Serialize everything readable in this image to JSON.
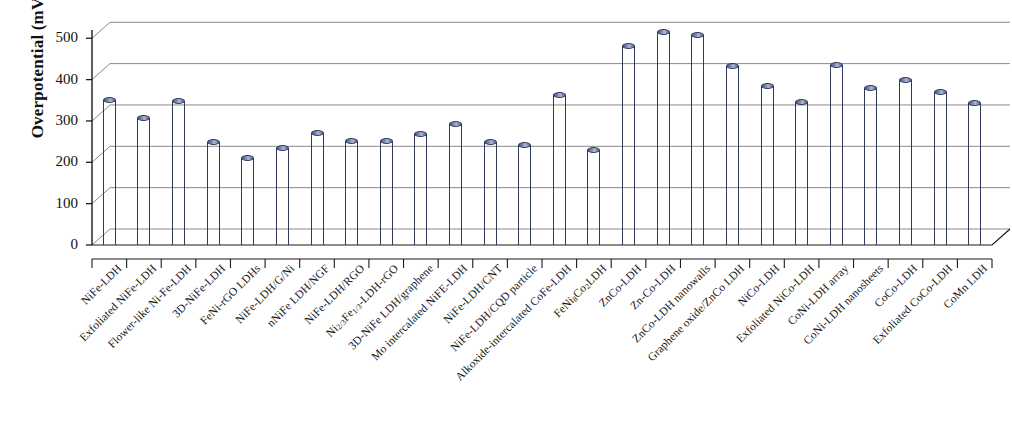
{
  "chart_data": {
    "type": "bar",
    "title": "",
    "xlabel": "",
    "ylabel": "Overpotential (mV)",
    "ylim": [
      0,
      520
    ],
    "yticks": [
      0,
      100,
      200,
      300,
      400,
      500
    ],
    "grid": true,
    "legend": "none",
    "bar_color": "#6c7ba6",
    "categories": [
      "NiFe-LDH",
      "Exfoliated NiFe-LDH",
      "Flower-like Ni-Fe-LDH",
      "3D-NiFe-LDH",
      "FeNi-rGO LDHs",
      "NiFe-LDH/G/Ni",
      "nNiFe LDH/NGF",
      "NiFe-LDH/RGO",
      "Ni2/3Fe1/3-LDH-rGO",
      "3D-NiFe LDH/graphene",
      "Mo intercalated NiFE-LDH",
      "NiFe-LDH/CNT",
      "NiFe-LDH/CQD particle",
      "Alkoxide-intercalated CoFe-LDH",
      "FeNi8Co2LDH",
      "ZnCo-LDH",
      "Zn-Co-LDH",
      "ZnCo-LDH nanowalls",
      "Graphene oxide/ZnCo LDH",
      "NiCo-LDH",
      "Exfoliated NiCo-LDH",
      "CoNi-LDH array",
      "CoNi-LDH nanosheets",
      "CoCo-LDH",
      "Exfoliated CoCo-LDH",
      "CoMn LDH"
    ],
    "values": [
      350,
      307,
      348,
      250,
      210,
      235,
      270,
      252,
      252,
      268,
      292,
      248,
      242,
      362,
      230,
      482,
      515,
      508,
      433,
      384,
      346,
      436,
      380,
      398,
      370,
      344
    ]
  },
  "axis": {
    "y_title": "Overpotential (mV)",
    "y_ticks": [
      "0",
      "100",
      "200",
      "300",
      "400",
      "500"
    ]
  },
  "categories_html": [
    "NiFe-LDH",
    "Exfoliated NiFe-LDH",
    "Flower-like Ni-Fe-LDH",
    "3D-NiFe-LDH",
    "FeNi-rGO LDHs",
    "NiFe-LDH/G/Ni",
    "nNiFe LDH/NGF",
    "NiFe-LDH/RGO",
    "Ni<sub>2/3</sub>Fe<sub>1/3</sub>-LDH-rGO",
    "3D-NiFe LDH/graphene",
    "Mo intercalated NiFE-LDH",
    "NiFe-LDH/CNT",
    "NiFe-LDH/CQD particle",
    "Alkoxide-intercalated CoFe-LDH",
    "FeNi<sub>8</sub>Co<sub>2</sub>LDH",
    "ZnCo-LDH",
    "Zn-Co-LDH",
    "ZnCo-LDH nanowalls",
    "Graphene oxide/ZnCo LDH",
    "NiCo-LDH",
    "Exfoliated NiCo-LDH",
    "CoNi-LDH array",
    "CoNi-LDH nanosheets",
    "CoCo-LDH",
    "Exfoliated CoCo-LDH",
    "CoMn LDH"
  ]
}
